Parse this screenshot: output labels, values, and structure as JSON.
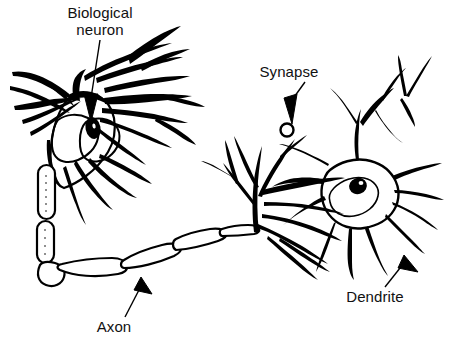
{
  "figure": {
    "background_color": "#ffffff",
    "ink_color": "#000000",
    "width": 451,
    "height": 356,
    "style": "black and white pen-and-ink line drawing"
  },
  "labels": {
    "biological_neuron": "Biological\nneuron",
    "synapse": "Synapse",
    "dendrite": "Dendrite",
    "axon": "Axon"
  },
  "annotations": [
    {
      "id": "biological-neuron",
      "text": "Biological neuron",
      "leader": "line with solid triangular arrowhead",
      "points_to": "cell body (soma) with dark nucleus of the left neuron"
    },
    {
      "id": "synapse",
      "text": "Synapse",
      "leader": "line with solid triangular arrowhead",
      "points_to": "small circular synaptic bouton on an axon terminal branch"
    },
    {
      "id": "dendrite",
      "text": "Dendrite",
      "leader": "line with solid triangular arrowhead",
      "points_to": "dendritic branch of the right neuron"
    },
    {
      "id": "axon",
      "text": "Axon",
      "leader": "line with solid triangular arrowhead",
      "points_to": "myelinated axon segment running horizontally"
    }
  ],
  "parts": [
    {
      "name": "left-neuron-soma",
      "description": "pear shaped cell body with dark oval nucleus"
    },
    {
      "name": "left-neuron-dendrites",
      "description": "many tapering branched dendrites radiating up, left and right"
    },
    {
      "name": "axon",
      "description": "long myelinated axon of chained capsule segments running down the left side then right across the page"
    },
    {
      "name": "axon-terminals",
      "description": "branching terminal arbor contacting the right neuron"
    },
    {
      "name": "synapse-bouton",
      "description": "small open circle where a terminal meets the next cell"
    },
    {
      "name": "right-neuron-soma",
      "description": "star shaped cell body with dark nucleus"
    },
    {
      "name": "right-neuron-dendrites",
      "description": "radiating dendrites spreading in all directions"
    }
  ]
}
